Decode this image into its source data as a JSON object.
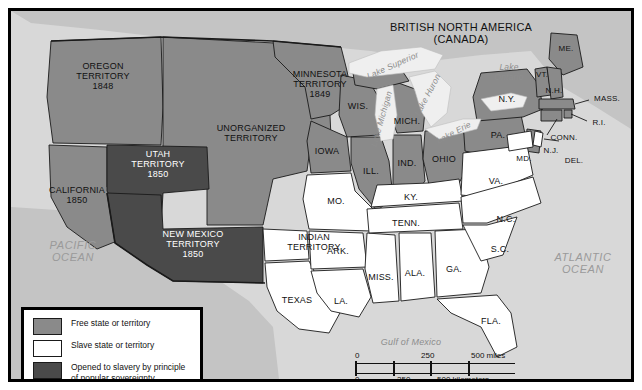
{
  "map": {
    "title_country_north": "BRITISH NORTH AMERICA\n(CANADA)",
    "title_country_south": "MEXICO",
    "oceans": {
      "pacific": "PACIFIC\nOCEAN",
      "atlantic": "ATLANTIC\nOCEAN",
      "gulf": "Gulf of Mexico"
    },
    "lakes": [
      {
        "name": "Lake Superior"
      },
      {
        "name": "Lake Michigan"
      },
      {
        "name": "Lake Huron"
      },
      {
        "name": "Lake Erie"
      },
      {
        "name": "Lake\nOntario"
      }
    ],
    "territories": [
      {
        "name": "OREGON\nTERRITORY\n1848",
        "status": "free"
      },
      {
        "name": "MINNESOTA\nTERRITORY\n1849",
        "status": "free"
      },
      {
        "name": "UNORGANIZED\nTERRITORY",
        "status": "free"
      },
      {
        "name": "UTAH\nTERRITORY\n1850",
        "status": "popular-sovereignty"
      },
      {
        "name": "NEW MEXICO\nTERRITORY\n1850",
        "status": "popular-sovereignty"
      },
      {
        "name": "INDIAN\nTERRITORY",
        "status": "slave"
      }
    ],
    "free_states": [
      "CALIFORNIA\n1850",
      "WIS.",
      "IOWA",
      "ILL.",
      "IND.",
      "OHIO",
      "MICH.",
      "PA.",
      "N.Y.",
      "ME.",
      "VT.",
      "N.H.",
      "MASS.",
      "R.I.",
      "CONN.",
      "N.J."
    ],
    "slave_states": [
      "TEXAS",
      "MO.",
      "ARK.",
      "LA.",
      "MISS.",
      "ALA.",
      "GA.",
      "FLA.",
      "TENN.",
      "KY.",
      "VA.",
      "N.C.",
      "S.C.",
      "MD.",
      "DEL."
    ],
    "labels": {
      "california": "CALIFORNIA\n1850",
      "oregon": "OREGON\nTERRITORY\n1848",
      "utah": "UTAH\nTERRITORY\n1850",
      "new_mexico": "NEW MEXICO\nTERRITORY\n1850",
      "unorganized": "UNORGANIZED\nTERRITORY",
      "minnesota": "MINNESOTA\nTERRITORY\n1849",
      "indian": "INDIAN\nTERRITORY",
      "texas": "TEXAS",
      "wis": "WIS.",
      "iowa": "IOWA",
      "mo": "MO.",
      "ill": "ILL.",
      "ind": "IND.",
      "ohio": "OHIO",
      "mich": "MICH.",
      "pa": "PA.",
      "ny": "N.Y.",
      "me": "ME.",
      "vt": "VT.",
      "nh": "N.H.",
      "mass": "MASS.",
      "ri": "R.I.",
      "conn": "CONN.",
      "nj": "N.J.",
      "md": "MD.",
      "del": "DEL.",
      "va": "VA.",
      "ky": "KY.",
      "tenn": "TENN.",
      "nc": "N.C.",
      "sc": "S.C.",
      "ga": "GA.",
      "ala": "ALA.",
      "miss": "MISS.",
      "ark": "ARK.",
      "la": "LA.",
      "fla": "FLA."
    }
  },
  "legend": {
    "items": [
      {
        "label": "Free state or territory",
        "color": "#8a8a8a"
      },
      {
        "label": "Slave state or territory",
        "color": "#ffffff"
      },
      {
        "label": "Opened to slavery by principle\nof popular sovereignty",
        "color": "#4a4a4a"
      }
    ]
  },
  "scale": {
    "miles": {
      "zero": "0",
      "mid": "250",
      "max": "500 miles"
    },
    "kilometers": {
      "zero": "0",
      "mid": "250",
      "max": "500 kilometers"
    }
  },
  "colors": {
    "free": "#8a8a8a",
    "slave": "#ffffff",
    "popular_sovereignty": "#4a4a4a",
    "water": "#d8d8d8",
    "lake": "#efefef",
    "border": "#1a1a1a"
  }
}
